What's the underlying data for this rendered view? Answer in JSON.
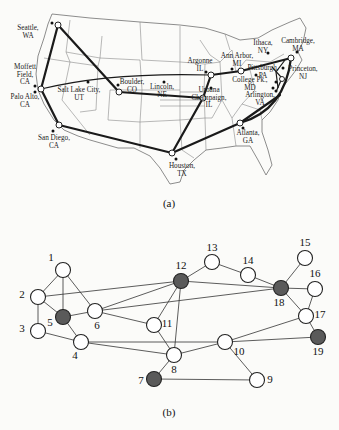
{
  "figure": {
    "caption_a": "(a)",
    "caption_b": "(b)"
  },
  "map": {
    "title": "US research network map",
    "cities": [
      {
        "id": "seattle",
        "line1": "Seattle,",
        "line2": "WA",
        "x": 28,
        "y": 30
      },
      {
        "id": "moffett",
        "line1": "Moffett",
        "line2": "Field,",
        "line3": "CA",
        "x": 25,
        "y": 69
      },
      {
        "id": "paloalto",
        "line1": "Palo Alto,",
        "line2": "CA",
        "x": 25,
        "y": 99
      },
      {
        "id": "saltlake",
        "line1": "Salt Lake City,",
        "line2": "UT",
        "x": 79,
        "y": 92
      },
      {
        "id": "sandiego",
        "line1": "San Diego,",
        "line2": "CA",
        "x": 54,
        "y": 140
      },
      {
        "id": "boulder",
        "line1": "Boulder,",
        "line2": "CO",
        "x": 132,
        "y": 84
      },
      {
        "id": "lincoln",
        "line1": "Lincoln,",
        "line2": "NE",
        "x": 162,
        "y": 89
      },
      {
        "id": "argonne",
        "line1": "Argonne",
        "line2": "IL",
        "x": 200,
        "y": 63
      },
      {
        "id": "annarbor",
        "line1": "Ann Arbor,",
        "line2": "MI",
        "x": 237,
        "y": 58
      },
      {
        "id": "ithaca",
        "line1": "Ithaca,",
        "line2": "NY",
        "x": 263,
        "y": 45
      },
      {
        "id": "cambridge",
        "line1": "Cambridge,",
        "line2": "MA",
        "x": 298,
        "y": 43
      },
      {
        "id": "pittsburgh",
        "line1": "Pittsburgh,",
        "line2": "PA",
        "x": 263,
        "y": 70
      },
      {
        "id": "princeton",
        "line1": "Princeton,",
        "line2": "NJ",
        "x": 303,
        "y": 71
      },
      {
        "id": "collegepark",
        "line1": "College Pk.,",
        "line2": "MD",
        "x": 250,
        "y": 82
      },
      {
        "id": "arlington",
        "line1": "Arlington,",
        "line2": "VA",
        "x": 260,
        "y": 97
      },
      {
        "id": "urbana",
        "line1": "Urbana",
        "line2": "Champaign,",
        "line3": "IL",
        "x": 209,
        "y": 92
      },
      {
        "id": "atlanta",
        "line1": "Atlanta,",
        "line2": "GA",
        "x": 248,
        "y": 135
      },
      {
        "id": "houston",
        "line1": "Houston,",
        "line2": "TX",
        "x": 182,
        "y": 168
      }
    ]
  },
  "graph": {
    "nodes": [
      {
        "id": "1",
        "x": 63,
        "y": 270,
        "filled": false
      },
      {
        "id": "2",
        "x": 38,
        "y": 297,
        "filled": false
      },
      {
        "id": "3",
        "x": 38,
        "y": 331,
        "filled": false
      },
      {
        "id": "4",
        "x": 81,
        "y": 342,
        "filled": false
      },
      {
        "id": "5",
        "x": 63,
        "y": 317,
        "filled": true
      },
      {
        "id": "6",
        "x": 95,
        "y": 311,
        "filled": false
      },
      {
        "id": "7",
        "x": 154,
        "y": 379,
        "filled": true
      },
      {
        "id": "8",
        "x": 174,
        "y": 355,
        "filled": false
      },
      {
        "id": "9",
        "x": 257,
        "y": 380,
        "filled": false
      },
      {
        "id": "10",
        "x": 225,
        "y": 342,
        "filled": false
      },
      {
        "id": "11",
        "x": 154,
        "y": 325,
        "filled": false
      },
      {
        "id": "12",
        "x": 181,
        "y": 281,
        "filled": true
      },
      {
        "id": "13",
        "x": 212,
        "y": 262,
        "filled": false
      },
      {
        "id": "14",
        "x": 248,
        "y": 275,
        "filled": false
      },
      {
        "id": "15",
        "x": 305,
        "y": 258,
        "filled": false
      },
      {
        "id": "16",
        "x": 315,
        "y": 289,
        "filled": false
      },
      {
        "id": "17",
        "x": 306,
        "y": 316,
        "filled": false
      },
      {
        "id": "18",
        "x": 281,
        "y": 288,
        "filled": true
      },
      {
        "id": "19",
        "x": 318,
        "y": 337,
        "filled": true
      }
    ],
    "edges": [
      [
        "1",
        "2"
      ],
      [
        "1",
        "5"
      ],
      [
        "1",
        "6"
      ],
      [
        "2",
        "3"
      ],
      [
        "2",
        "5"
      ],
      [
        "2",
        "12"
      ],
      [
        "3",
        "4"
      ],
      [
        "5",
        "6"
      ],
      [
        "5",
        "4"
      ],
      [
        "6",
        "12"
      ],
      [
        "6",
        "18"
      ],
      [
        "6",
        "11"
      ],
      [
        "4",
        "10"
      ],
      [
        "4",
        "8"
      ],
      [
        "11",
        "12"
      ],
      [
        "11",
        "8"
      ],
      [
        "12",
        "8"
      ],
      [
        "12",
        "13"
      ],
      [
        "12",
        "18"
      ],
      [
        "13",
        "14"
      ],
      [
        "14",
        "18"
      ],
      [
        "18",
        "15"
      ],
      [
        "18",
        "16"
      ],
      [
        "18",
        "17"
      ],
      [
        "16",
        "17"
      ],
      [
        "17",
        "19"
      ],
      [
        "17",
        "10"
      ],
      [
        "10",
        "19"
      ],
      [
        "10",
        "8"
      ],
      [
        "10",
        "9"
      ],
      [
        "8",
        "7"
      ],
      [
        "7",
        "9"
      ]
    ],
    "colors": {
      "filled": "#5a5a5a",
      "empty": "#ffffff"
    }
  }
}
